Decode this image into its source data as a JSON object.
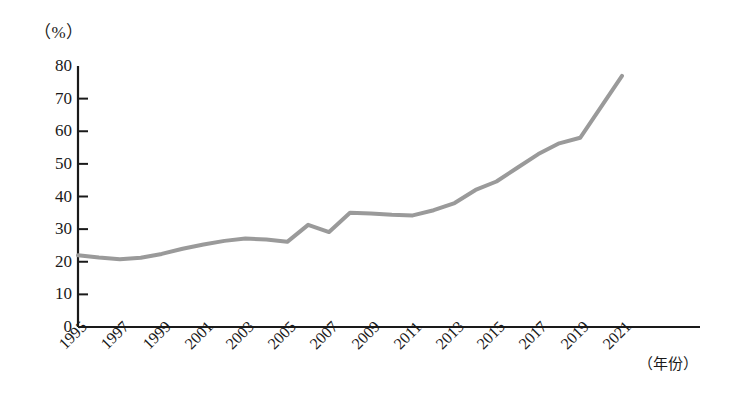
{
  "chart_data": {
    "type": "line",
    "title": "",
    "subtitle": "",
    "xlabel": "（年份）",
    "ylabel": "（%）",
    "ylim": [
      0,
      80
    ],
    "xlim": [
      1995,
      2021
    ],
    "grid": false,
    "legend": false,
    "legend_position": "none",
    "line_color": "#9a9a9a",
    "axis_color": "#1a1a1a",
    "y_ticks": [
      80,
      70,
      60,
      50,
      40,
      30,
      20,
      10,
      0
    ],
    "y_tick_labels": [
      "80",
      "70",
      "60",
      "50",
      "40",
      "30",
      "20",
      "10",
      "0"
    ],
    "x_ticks": [
      1995,
      1997,
      1999,
      2001,
      2003,
      2005,
      2007,
      2009,
      2011,
      2013,
      2015,
      2017,
      2019,
      2021
    ],
    "x_tick_labels": [
      "1995",
      "1997",
      "1999",
      "2001",
      "2003",
      "2005",
      "2007",
      "2009",
      "2011",
      "2013",
      "2015",
      "2017",
      "2019",
      "2021"
    ],
    "x": [
      1995,
      1996,
      1997,
      1998,
      1999,
      2000,
      2001,
      2002,
      2003,
      2004,
      2005,
      2006,
      2007,
      2008,
      2009,
      2010,
      2011,
      2012,
      2013,
      2014,
      2015,
      2016,
      2017,
      2018,
      2019,
      2020,
      2021
    ],
    "values": [
      22.0,
      21.3,
      20.8,
      21.2,
      22.4,
      24.0,
      25.3,
      26.4,
      27.1,
      26.8,
      26.1,
      31.3,
      29.1,
      35.0,
      34.8,
      34.4,
      34.2,
      35.8,
      38.0,
      42.0,
      44.6,
      48.8,
      53.0,
      56.3,
      58.0,
      67.5,
      77.0
    ],
    "series": [
      {
        "name": "",
        "color": "#9a9a9a",
        "values": [
          22.0,
          21.3,
          20.8,
          21.2,
          22.4,
          24.0,
          25.3,
          26.4,
          27.1,
          26.8,
          26.1,
          31.3,
          29.1,
          35.0,
          34.8,
          34.4,
          34.2,
          35.8,
          38.0,
          42.0,
          44.6,
          48.8,
          53.0,
          56.3,
          58.0,
          67.5,
          77.0
        ]
      }
    ]
  }
}
